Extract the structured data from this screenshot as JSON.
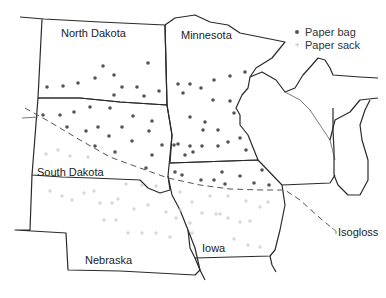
{
  "map": {
    "states": [
      {
        "name": "North Dakota",
        "label": "North Dakota"
      },
      {
        "name": "Minnesota",
        "label": "Minnesota"
      },
      {
        "name": "South Dakota",
        "label": "South Dakota"
      },
      {
        "name": "Nebraska",
        "label": "Nebraska"
      },
      {
        "name": "Iowa",
        "label": "Iowa"
      }
    ],
    "isogloss_label": "Isogloss"
  },
  "legend": {
    "items": [
      {
        "label": "Paper bag",
        "symbol": "dot",
        "color": "#555555"
      },
      {
        "label": "Paper sack",
        "symbol": "plus",
        "color": "#c8c8c8"
      }
    ]
  }
}
